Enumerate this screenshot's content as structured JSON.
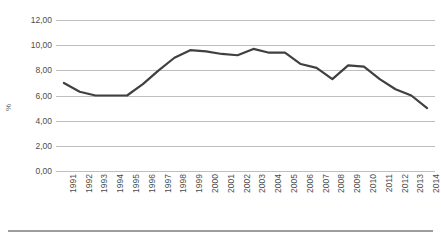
{
  "chart_data": {
    "type": "line",
    "title": "",
    "subtitle": "",
    "xlabel": "",
    "ylabel": "%",
    "grid": true,
    "legend": false,
    "legend_position": "none",
    "line_color": "#404040",
    "gridline_color": "#bfbfbf",
    "background_color": "#ffffff",
    "ylim": [
      0,
      12
    ],
    "ytick_labels": [
      "12,00",
      "10,00",
      "8,00",
      "6,00",
      "4,00",
      "2,00",
      "0,00"
    ],
    "ytick_values": [
      12,
      10,
      8,
      6,
      4,
      2,
      0
    ],
    "categories": [
      "1991",
      "1992",
      "1993",
      "1994",
      "1995",
      "1996",
      "1997",
      "1998",
      "1999",
      "2000",
      "2001",
      "2002",
      "2003",
      "2004",
      "2005",
      "2006",
      "2007",
      "2008",
      "2009",
      "2010",
      "2011",
      "2012",
      "2013",
      "2014"
    ],
    "values": [
      7.0,
      6.3,
      6.0,
      6.0,
      6.0,
      6.9,
      8.0,
      9.0,
      9.6,
      9.5,
      9.3,
      9.2,
      9.7,
      9.4,
      9.4,
      8.5,
      8.2,
      7.3,
      8.4,
      8.3,
      7.3,
      6.5,
      6.0,
      5.0
    ],
    "series": [
      {
        "name": "",
        "values": [
          7.0,
          6.3,
          6.0,
          6.0,
          6.0,
          6.9,
          8.0,
          9.0,
          9.6,
          9.5,
          9.3,
          9.2,
          9.7,
          9.4,
          9.4,
          8.5,
          8.2,
          7.3,
          8.4,
          8.3,
          7.3,
          6.5,
          6.0,
          5.0
        ]
      }
    ]
  }
}
